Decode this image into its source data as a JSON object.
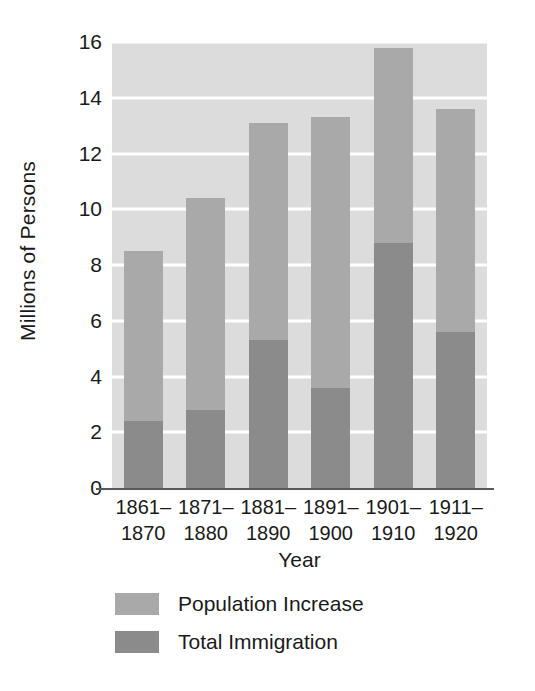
{
  "chart_data": {
    "type": "bar",
    "subtype": "stacked-bar",
    "title": "",
    "xlabel": "Year",
    "ylabel": "Millions of Persons",
    "ylim": [
      0,
      16
    ],
    "ytick_step": 2,
    "yticks": [
      16,
      14,
      12,
      10,
      8,
      6,
      4,
      2,
      0
    ],
    "grid": true,
    "grid_color": "#ffffff",
    "plot_background": "#dcdcdc",
    "legend_position": "bottom-left",
    "categories": [
      "1861–\n1870",
      "1871–\n1880",
      "1881–\n1890",
      "1891–\n1900",
      "1901–\n1910",
      "1911–\n1920"
    ],
    "category_lines": [
      [
        "1861–",
        "1870"
      ],
      [
        "1871–",
        "1880"
      ],
      [
        "1881–",
        "1890"
      ],
      [
        "1891–",
        "1900"
      ],
      [
        "1901–",
        "1910"
      ],
      [
        "1911–",
        "1920"
      ]
    ],
    "series": [
      {
        "name": "Total Immigration",
        "color": "#8b8b8b",
        "values": [
          2.4,
          2.8,
          5.3,
          3.6,
          8.8,
          5.6
        ]
      },
      {
        "name": "Population Increase",
        "color": "#a9a9a9",
        "values": [
          6.1,
          7.6,
          7.8,
          9.7,
          7.0,
          8.0
        ]
      }
    ],
    "totals": [
      8.5,
      10.4,
      13.1,
      13.3,
      15.8,
      13.6
    ],
    "stack_order": [
      "Total Immigration",
      "Population Increase"
    ]
  },
  "axis": {
    "y_title": "Millions of Persons",
    "x_title": "Year",
    "y_ticks": [
      "16",
      "14",
      "12",
      "10",
      "8",
      "6",
      "4",
      "2",
      "0"
    ]
  },
  "legend": {
    "items": [
      {
        "label": "Population Increase",
        "color": "#a9a9a9"
      },
      {
        "label": "Total Immigration",
        "color": "#8b8b8b"
      }
    ]
  }
}
